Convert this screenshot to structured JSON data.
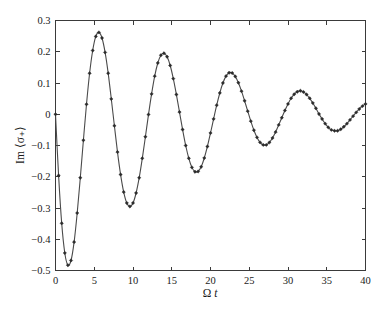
{
  "chart_data": {
    "type": "line",
    "title": "",
    "xlabel": "Ω t",
    "ylabel": "Im ⟨σ₊⟩",
    "xlim": [
      0,
      40
    ],
    "ylim": [
      -0.5,
      0.3
    ],
    "xticks": [
      0,
      5,
      10,
      15,
      20,
      25,
      30,
      35,
      40
    ],
    "xtick_labels": [
      "0",
      "5",
      "10",
      "15",
      "20",
      "25",
      "30",
      "35",
      "40"
    ],
    "yticks": [
      -0.5,
      -0.4,
      -0.3,
      -0.2,
      -0.1,
      0,
      0.1,
      0.2,
      0.3
    ],
    "ytick_labels": [
      "−0.5",
      "−0.4",
      "−0.3",
      "−0.2",
      "−0.1",
      "0",
      "0.1",
      "0.2",
      "0.3"
    ],
    "grid": false,
    "legend": false,
    "line_color": "#4a4a4a",
    "marker_color": "#2b2b2b",
    "marker": "diamond",
    "series": [
      {
        "name": "Im <sigma_+>",
        "x": [
          0,
          0.4,
          0.8,
          1.2,
          1.6,
          2,
          2.4,
          2.8,
          3.2,
          3.6,
          4,
          4.4,
          4.8,
          5.2,
          5.6,
          6,
          6.4,
          6.8,
          7.2,
          7.6,
          8,
          8.4,
          8.8,
          9.2,
          9.6,
          10,
          10.4,
          10.8,
          11.2,
          11.6,
          12,
          12.4,
          12.8,
          13.2,
          13.6,
          14,
          14.4,
          14.8,
          15.2,
          15.6,
          16,
          16.4,
          16.8,
          17.2,
          17.6,
          18,
          18.4,
          18.8,
          19.2,
          19.6,
          20,
          20.4,
          20.8,
          21.2,
          21.6,
          22,
          22.4,
          22.8,
          23.2,
          23.6,
          24,
          24.4,
          24.8,
          25.2,
          25.6,
          26,
          26.4,
          26.8,
          27.2,
          27.6,
          28,
          28.4,
          28.8,
          29.2,
          29.6,
          30,
          30.4,
          30.8,
          31.2,
          31.6,
          32,
          32.4,
          32.8,
          33.2,
          33.6,
          34,
          34.4,
          34.8,
          35.2,
          35.6,
          36,
          36.4,
          36.8,
          37.2,
          37.6,
          38,
          38.4,
          38.8,
          39.2,
          39.6,
          40
        ],
        "y": [
          0,
          -0.196,
          -0.349,
          -0.444,
          -0.483,
          -0.468,
          -0.409,
          -0.316,
          -0.203,
          -0.083,
          0.032,
          0.131,
          0.204,
          0.249,
          0.262,
          0.244,
          0.198,
          0.131,
          0.049,
          -0.037,
          -0.121,
          -0.193,
          -0.249,
          -0.284,
          -0.295,
          -0.284,
          -0.252,
          -0.203,
          -0.141,
          -0.072,
          -0.001,
          0.065,
          0.122,
          0.164,
          0.189,
          0.195,
          0.184,
          0.156,
          0.114,
          0.063,
          0.007,
          -0.049,
          -0.1,
          -0.141,
          -0.17,
          -0.184,
          -0.183,
          -0.168,
          -0.14,
          -0.103,
          -0.06,
          -0.015,
          0.029,
          0.068,
          0.1,
          0.122,
          0.133,
          0.132,
          0.121,
          0.101,
          0.074,
          0.043,
          0.01,
          -0.022,
          -0.051,
          -0.074,
          -0.09,
          -0.098,
          -0.098,
          -0.09,
          -0.076,
          -0.057,
          -0.034,
          -0.011,
          0.012,
          0.033,
          0.051,
          0.064,
          0.072,
          0.075,
          0.071,
          0.063,
          0.051,
          0.036,
          0.019,
          0.001,
          -0.015,
          -0.03,
          -0.042,
          -0.05,
          -0.053,
          -0.053,
          -0.048,
          -0.04,
          -0.03,
          -0.018,
          -0.006,
          0.006,
          0.017,
          0.026,
          0.033
        ]
      }
    ]
  },
  "figure": {
    "background_color": "#ffffff",
    "axes_color": "#3a3a3a"
  }
}
